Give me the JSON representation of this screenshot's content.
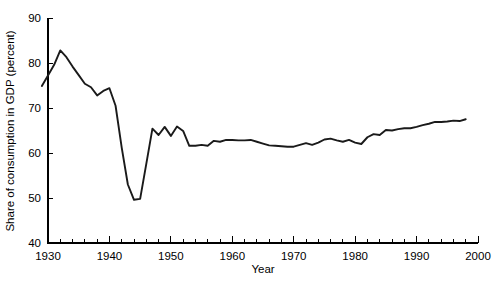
{
  "chart_data": {
    "type": "line",
    "title": "",
    "xlabel": "Year",
    "ylabel": "Share of consumption in GDP (percent)",
    "xlim": [
      1930,
      2000
    ],
    "ylim": [
      40,
      90
    ],
    "grid": false,
    "legend": null,
    "line_color": "#1a1a1a",
    "background_color": "#ffffff",
    "x_major_ticks": [
      1930,
      1940,
      1950,
      1960,
      1970,
      1980,
      1990,
      2000
    ],
    "x_major_tick_labels": [
      "1930",
      "1940",
      "1950",
      "1960",
      "1970",
      "1980",
      "1990",
      "2000"
    ],
    "x_minor_tick_step": 2,
    "y_ticks": [
      40,
      50,
      60,
      70,
      80,
      90
    ],
    "y_tick_labels": [
      "40",
      "50",
      "60",
      "70",
      "80",
      "90"
    ],
    "series": [
      {
        "name": "Share of consumption in GDP",
        "x": [
          1929,
          1930,
          1931,
          1932,
          1933,
          1934,
          1935,
          1936,
          1937,
          1938,
          1939,
          1940,
          1941,
          1942,
          1943,
          1944,
          1945,
          1946,
          1947,
          1948,
          1949,
          1950,
          1951,
          1952,
          1953,
          1954,
          1955,
          1956,
          1957,
          1958,
          1959,
          1960,
          1961,
          1962,
          1963,
          1964,
          1965,
          1966,
          1967,
          1968,
          1969,
          1970,
          1971,
          1972,
          1973,
          1974,
          1975,
          1976,
          1977,
          1978,
          1979,
          1980,
          1981,
          1982,
          1983,
          1984,
          1985,
          1986,
          1987,
          1988,
          1989,
          1990,
          1991,
          1992,
          1993,
          1994,
          1995,
          1996,
          1997,
          1998
        ],
        "values": [
          74.9,
          77.2,
          79.6,
          82.8,
          81.3,
          79.2,
          77.3,
          75.4,
          74.6,
          72.8,
          73.8,
          74.4,
          70.5,
          61.2,
          53.0,
          49.6,
          49.8,
          57.6,
          65.4,
          64.0,
          65.8,
          63.8,
          65.9,
          64.9,
          61.6,
          61.6,
          61.8,
          61.6,
          62.7,
          62.5,
          62.9,
          62.9,
          62.8,
          62.8,
          62.9,
          62.5,
          62.1,
          61.7,
          61.6,
          61.5,
          61.4,
          61.4,
          61.8,
          62.2,
          61.8,
          62.3,
          63.0,
          63.2,
          62.8,
          62.5,
          62.9,
          62.3,
          62.0,
          63.5,
          64.2,
          64.0,
          65.1,
          65.0,
          65.3,
          65.5,
          65.5,
          65.8,
          66.2,
          66.5,
          66.9,
          66.9,
          67.0,
          67.2,
          67.1,
          67.5
        ]
      }
    ]
  }
}
